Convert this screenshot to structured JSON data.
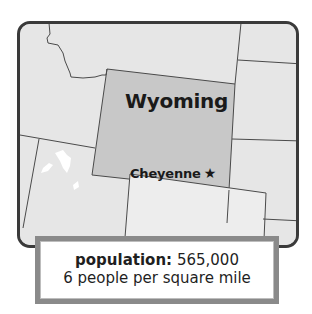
{
  "map": {
    "state_name": "Wyoming",
    "capital": "Cheyenne",
    "capital_marker": "★",
    "colors": {
      "highlight_state": "#c8c8c8",
      "neighbor_states": "#e6e6e6",
      "border_lines": "#4a4a4a",
      "frame": "#3a3a3a",
      "water": "#ffffff"
    }
  },
  "info": {
    "population_label": "population:",
    "population_value": "565,000",
    "density": "6 people per square mile"
  }
}
